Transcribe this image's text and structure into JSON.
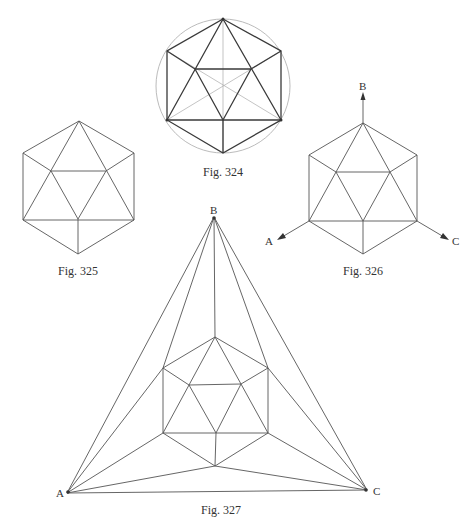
{
  "figures": {
    "fig324": {
      "caption": "Fig. 324"
    },
    "fig325": {
      "caption": "Fig. 325"
    },
    "fig326": {
      "caption": "Fig. 326",
      "axes": {
        "a": "A",
        "b": "B",
        "c": "C"
      }
    },
    "fig327": {
      "caption": "Fig. 327",
      "vertices": {
        "a": "A",
        "b": "B",
        "c": "C"
      }
    }
  },
  "colors": {
    "line": "#555555",
    "heavy_line": "#3a3a3a",
    "light_line": "#aaaaaa",
    "background": "#ffffff"
  }
}
